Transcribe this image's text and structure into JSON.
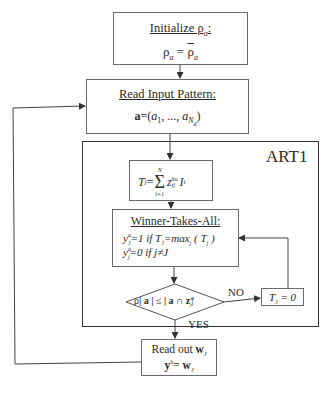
{
  "diagram": {
    "type": "flowchart",
    "frame_label": "ART1",
    "nodes": {
      "initialize": {
        "title": "Initialize ρ",
        "title_sub": "a",
        "title_suffix": ":",
        "eq_lhs": "ρ",
        "eq_lhs_sub": "a",
        "eq_op": " = ",
        "eq_rhs": "ρ",
        "eq_rhs_sub": "a"
      },
      "read_input": {
        "title": "Read Input Pattern:",
        "eq_bold": "a",
        "eq_prefix": "=(",
        "eq_a1": "a",
        "eq_a1_sub": "1",
        "eq_mid": ", ..., ",
        "eq_an": "a",
        "eq_an_sub": "N",
        "eq_an_subsub": "d",
        "eq_suffix": ")"
      },
      "activation": {
        "lhs": "T",
        "lhs_sub": "j",
        "eq": " =",
        "sum_top": "N",
        "sum_symbol": "Σ",
        "sum_bottom": "i=1",
        "z": "z",
        "z_sup": "bu",
        "z_sub": "ij",
        "i": "I",
        "i_sub": "i"
      },
      "winner_takes_all": {
        "title": "Winner-Takes-All:",
        "line1": "y",
        "line1_sup": "a",
        "line1_sub": "J",
        "line1_rest": "=1 if  T",
        "line1_rest_sub": "J",
        "line1_tail": "=max",
        "line1_tail_sub": "j",
        "line1_end": " ( T",
        "line1_end_sub": "j",
        "line1_close": " )",
        "line2": "y",
        "line2_sup": "a",
        "line2_sub": "j",
        "line2_rest": "=0 if  j≠J"
      },
      "vigilance_test": {
        "rho": "ρ",
        "abs_a": "| a |",
        "leq": " ≤ ",
        "rhs": "| a ∩  z",
        "rhs_sup": "td",
        "rhs_sub": "J",
        "rhs_close": "|"
      },
      "reset": {
        "lhs": "T",
        "lhs_sub": "J",
        "rhs": " = 0"
      },
      "readout": {
        "line1": "Read out  ",
        "line1_bold": "w",
        "line1_sub": "J",
        "line2_bold": "y",
        "line2_sup": "b",
        "line2_eq": "= ",
        "line2_w": "w",
        "line2_sub": "J"
      }
    },
    "edge_labels": {
      "no": "NO",
      "yes": "YES"
    },
    "colors": {
      "lines": "#444444",
      "box_border": "#6a6a6a",
      "frame_border": "#333333",
      "text": "#2a2a2a"
    }
  }
}
